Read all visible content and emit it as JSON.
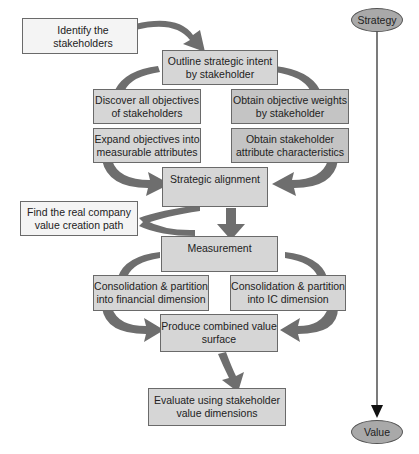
{
  "diagram": {
    "nodes": {
      "identify": "Identify the stakeholders",
      "outline": "Outline strategic intent by stakeholder",
      "discover": "Discover all objectives of stakeholders",
      "weights": "Obtain objective weights by stakeholder",
      "expand": "Expand objectives into measurable attributes",
      "characteristics": "Obtain stakeholder attribute characteristics",
      "alignment": "Strategic alignment",
      "find_path": "Find the real company value creation path",
      "measurement": "Measurement",
      "financial": "Consolidation & partition into financial dimension",
      "ic": "Consolidation & partition into IC dimension",
      "combined": "Produce combined value surface",
      "evaluate": "Evaluate using stakeholder value dimensions"
    },
    "axis": {
      "start": "Strategy",
      "end": "Value"
    },
    "colors": {
      "arrow": "#6e6e6e",
      "box_fill": "#d6d6d6",
      "oval_fill": "#a9a9a9"
    }
  }
}
